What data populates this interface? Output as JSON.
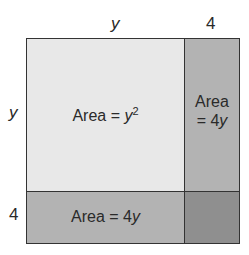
{
  "labels": {
    "top_y": "y",
    "top_4": "4",
    "left_y": "y",
    "left_4": "4"
  },
  "regions": {
    "big_square": {
      "prefix": "Area = ",
      "var": "y",
      "exp": "2",
      "color": "#e8e8e8"
    },
    "right_rect": {
      "line1": "Area",
      "line2": "= 4",
      "var": "y",
      "color": "#b3b3b3"
    },
    "bottom_rect": {
      "prefix": "Area = 4",
      "var": "y",
      "color": "#b3b3b3"
    },
    "small_square": {
      "color": "#8f8f8f"
    }
  },
  "colors": {
    "border": "#333333"
  }
}
